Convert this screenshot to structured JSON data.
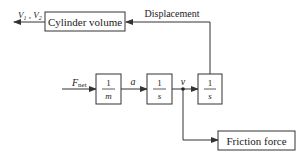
{
  "blocks": {
    "cylinder_volume": "Cylinder volume",
    "friction_force": "Friction force",
    "gain_inverse_mass": {
      "num": "1",
      "den": "m"
    },
    "integrator_1": {
      "num": "1",
      "den": "s"
    },
    "integrator_2": {
      "num": "1",
      "den": "s"
    }
  },
  "signals": {
    "input": "F",
    "input_sub": "net",
    "acceleration": "a",
    "velocity": "v",
    "displacement": "Displacement",
    "volumes": "V",
    "volumes_sub1": "1",
    "volumes_sep": " , ",
    "volumes_sub2": "2"
  },
  "colors": {
    "line": "#333333",
    "box": "#333333",
    "text": "#222222"
  }
}
